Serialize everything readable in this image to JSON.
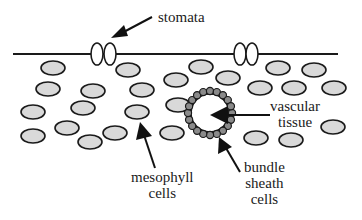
{
  "diagram": {
    "colors": {
      "cell_fill": "#d9d9d9",
      "cell_stroke": "#1a1a1a",
      "sheath_fill": "#8a8a8a",
      "background": "#ffffff"
    },
    "labels": {
      "stomata": "stomata",
      "vascular_line1": "vascular",
      "vascular_line2": "tissue",
      "mesophyll_line1": "mesophyll",
      "mesophyll_line2": "cells",
      "bundle_line1": "bundle",
      "bundle_line2": "sheath",
      "bundle_line3": "cells"
    },
    "epidermis_line": {
      "x1": 13,
      "x2": 338,
      "y": 54
    },
    "stomata_positions": [
      {
        "x": 103,
        "y": 54
      },
      {
        "x": 245,
        "y": 54
      }
    ],
    "mesophyll_cells": [
      {
        "x": 53,
        "y": 68
      },
      {
        "x": 128,
        "y": 70
      },
      {
        "x": 201,
        "y": 67
      },
      {
        "x": 278,
        "y": 68
      },
      {
        "x": 314,
        "y": 70
      },
      {
        "x": 48,
        "y": 89
      },
      {
        "x": 93,
        "y": 91
      },
      {
        "x": 142,
        "y": 90
      },
      {
        "x": 176,
        "y": 80
      },
      {
        "x": 228,
        "y": 78
      },
      {
        "x": 260,
        "y": 88
      },
      {
        "x": 294,
        "y": 88
      },
      {
        "x": 334,
        "y": 88
      },
      {
        "x": 33,
        "y": 112
      },
      {
        "x": 83,
        "y": 108
      },
      {
        "x": 137,
        "y": 112
      },
      {
        "x": 178,
        "y": 105
      },
      {
        "x": 67,
        "y": 128
      },
      {
        "x": 115,
        "y": 133
      },
      {
        "x": 33,
        "y": 136
      },
      {
        "x": 90,
        "y": 142
      },
      {
        "x": 172,
        "y": 133
      },
      {
        "x": 333,
        "y": 127
      },
      {
        "x": 256,
        "y": 138
      },
      {
        "x": 291,
        "y": 140
      }
    ],
    "vascular_bundle": {
      "cx": 210,
      "cy": 113,
      "r": 20,
      "sheath_cell_count": 20
    }
  }
}
